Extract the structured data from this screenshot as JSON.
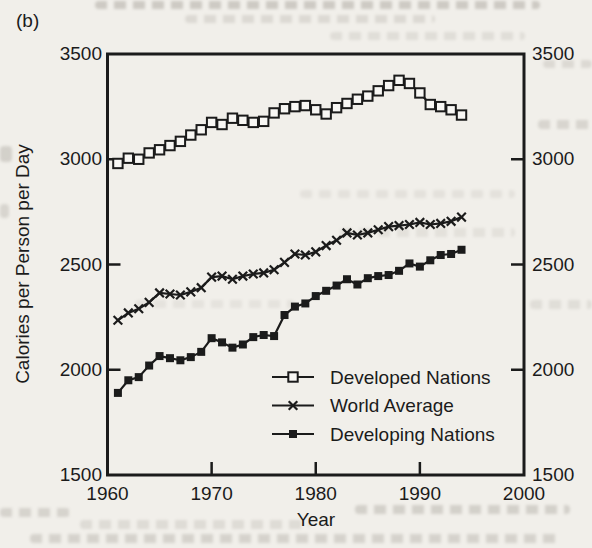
{
  "figure_label": "(b)",
  "axes": {
    "x_label": "Year",
    "y_label": "Calories per Person per Day",
    "x_ticks": [
      1960,
      1970,
      1980,
      1990,
      2000
    ],
    "y_ticks": [
      3500,
      3000,
      2500,
      2000,
      1500
    ],
    "x_range": [
      1960,
      2000
    ],
    "y_range": [
      1500,
      3500
    ]
  },
  "colors": {
    "ink": "#1b1b1b",
    "paper": "#f1efea",
    "marker_fill": "#f8f7f4"
  },
  "chart_data": {
    "type": "line",
    "title": "",
    "xlabel": "Year",
    "ylabel": "Calories per Person per Day",
    "xlim": [
      1960,
      2000
    ],
    "ylim": [
      1500,
      3500
    ],
    "grid": false,
    "legend_position": "inside-bottom-right",
    "x": [
      1961,
      1962,
      1963,
      1964,
      1965,
      1966,
      1967,
      1968,
      1969,
      1970,
      1971,
      1972,
      1973,
      1974,
      1975,
      1976,
      1977,
      1978,
      1979,
      1980,
      1981,
      1982,
      1983,
      1984,
      1985,
      1986,
      1987,
      1988,
      1989,
      1990,
      1991,
      1992,
      1993,
      1994
    ],
    "series": [
      {
        "name": "Developed Nations",
        "marker": "open-square",
        "values": [
          2980,
          3005,
          3000,
          3030,
          3045,
          3065,
          3085,
          3115,
          3140,
          3175,
          3165,
          3195,
          3185,
          3175,
          3180,
          3220,
          3240,
          3250,
          3255,
          3235,
          3215,
          3245,
          3265,
          3285,
          3300,
          3325,
          3350,
          3375,
          3360,
          3315,
          3260,
          3250,
          3235,
          3210
        ]
      },
      {
        "name": "World Average",
        "marker": "x",
        "values": [
          2235,
          2270,
          2290,
          2320,
          2365,
          2360,
          2355,
          2370,
          2390,
          2440,
          2445,
          2430,
          2445,
          2455,
          2460,
          2475,
          2510,
          2550,
          2545,
          2560,
          2590,
          2615,
          2650,
          2640,
          2650,
          2665,
          2680,
          2685,
          2690,
          2700,
          2690,
          2695,
          2705,
          2725
        ]
      },
      {
        "name": "Developing Nations",
        "marker": "filled-square",
        "values": [
          1890,
          1950,
          1965,
          2020,
          2065,
          2055,
          2045,
          2060,
          2085,
          2150,
          2130,
          2105,
          2120,
          2155,
          2165,
          2160,
          2260,
          2300,
          2315,
          2350,
          2375,
          2400,
          2430,
          2405,
          2435,
          2445,
          2450,
          2470,
          2505,
          2490,
          2520,
          2545,
          2550,
          2570
        ]
      }
    ]
  }
}
